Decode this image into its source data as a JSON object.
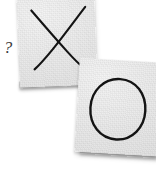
{
  "scene": {
    "title": "Two paper cards with hand-drawn symbols",
    "background_color": "#ffffff",
    "width": 156,
    "height": 177
  },
  "annotation": {
    "question_mark": "?"
  },
  "cards": [
    {
      "id": "card-x",
      "symbol": "X",
      "symbol_name": "cross-mark",
      "position": "top-left",
      "paper_color": "#eaeaea",
      "ink_color": "#141414",
      "rotation_deg": -2.2
    },
    {
      "id": "card-o",
      "symbol": "O",
      "symbol_name": "circle-mark",
      "position": "bottom-right",
      "paper_color": "#eaeaea",
      "ink_color": "#141414",
      "rotation_deg": 3.4
    }
  ]
}
